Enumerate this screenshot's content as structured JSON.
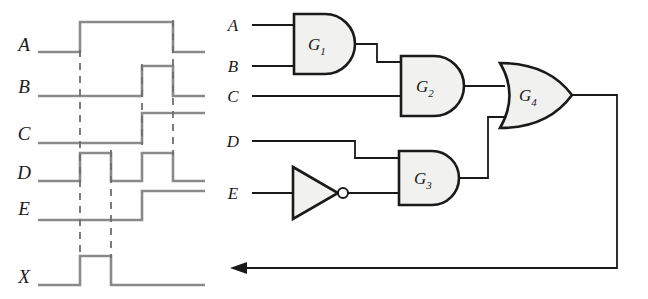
{
  "figure": {
    "type": "logic-circuit-with-timing-diagram",
    "background_color": "#ffffff"
  },
  "colors": {
    "waveform_stroke": "#8a8a8a",
    "dashed_stroke": "#6e6e6e",
    "circuit_stroke": "#1a1a1a",
    "gate_fill": "#f1f1ef",
    "text": "#1a1a1a"
  },
  "timing_diagram": {
    "name": "timing-diagram",
    "signals": [
      {
        "label": "A",
        "baseline_y": 52,
        "high_y": 22,
        "segments": [
          [
            38,
            80,
            "low"
          ],
          [
            80,
            173,
            "high"
          ],
          [
            173,
            205,
            "low"
          ]
        ]
      },
      {
        "label": "B",
        "baseline_y": 96,
        "high_y": 66,
        "segments": [
          [
            38,
            142,
            "low"
          ],
          [
            142,
            173,
            "high"
          ],
          [
            173,
            205,
            "low"
          ]
        ]
      },
      {
        "label": "C",
        "baseline_y": 143,
        "high_y": 113,
        "segments": [
          [
            38,
            142,
            "low"
          ],
          [
            142,
            205,
            "high"
          ]
        ]
      },
      {
        "label": "D",
        "baseline_y": 181,
        "high_y": 153,
        "segments": [
          [
            38,
            80,
            "low"
          ],
          [
            80,
            111,
            "high"
          ],
          [
            111,
            142,
            "low"
          ],
          [
            142,
            173,
            "high"
          ],
          [
            173,
            205,
            "low"
          ]
        ]
      },
      {
        "label": "E",
        "baseline_y": 220,
        "high_y": 191,
        "segments": [
          [
            38,
            142,
            "low"
          ],
          [
            142,
            205,
            "high"
          ]
        ]
      },
      {
        "label": "X",
        "baseline_y": 285,
        "high_y": 256,
        "segments": [
          [
            38,
            80,
            "low"
          ],
          [
            80,
            111,
            "high"
          ],
          [
            111,
            205,
            "low"
          ]
        ]
      }
    ],
    "marker_lines_x": [
      80,
      111,
      142,
      173
    ],
    "label_x": 24
  },
  "circuit": {
    "name": "logic-circuit",
    "inputs": [
      {
        "label": "A",
        "label_x": 230,
        "y": 25
      },
      {
        "label": "B",
        "label_x": 230,
        "y": 66
      },
      {
        "label": "C",
        "label_x": 230,
        "y": 96
      },
      {
        "label": "D",
        "label_x": 230,
        "y": 141
      },
      {
        "label": "E",
        "label_x": 230,
        "y": 193
      }
    ],
    "gates": [
      {
        "id": "G1",
        "label": "G",
        "subscript": "1",
        "kind": "and",
        "x": 293,
        "y": 10,
        "w": 60,
        "h": 60,
        "label_x": 312,
        "label_y": 46
      },
      {
        "id": "G2",
        "label": "G",
        "subscript": "2",
        "kind": "and",
        "x": 400,
        "y": 55,
        "w": 64,
        "h": 60,
        "label_x": 419,
        "label_y": 91
      },
      {
        "id": "G3",
        "label": "G",
        "subscript": "3",
        "kind": "and",
        "x": 398,
        "y": 150,
        "w": 62,
        "h": 55,
        "label_x": 416,
        "label_y": 183
      },
      {
        "id": "G4",
        "label": "G",
        "subscript": "4",
        "kind": "or",
        "x": 500,
        "y": 63,
        "w": 72,
        "h": 65,
        "label_x": 521,
        "label_y": 100
      }
    ],
    "inverter": {
      "id": "INV",
      "kind": "not",
      "x": 292,
      "y": 167,
      "w": 46,
      "h": 52,
      "bubble_cx": 343,
      "bubble_r": 5
    },
    "feedback": {
      "name": "feedback-arrow",
      "from_x": 617,
      "y": 268,
      "to_x": 232,
      "output_y": 95
    }
  }
}
